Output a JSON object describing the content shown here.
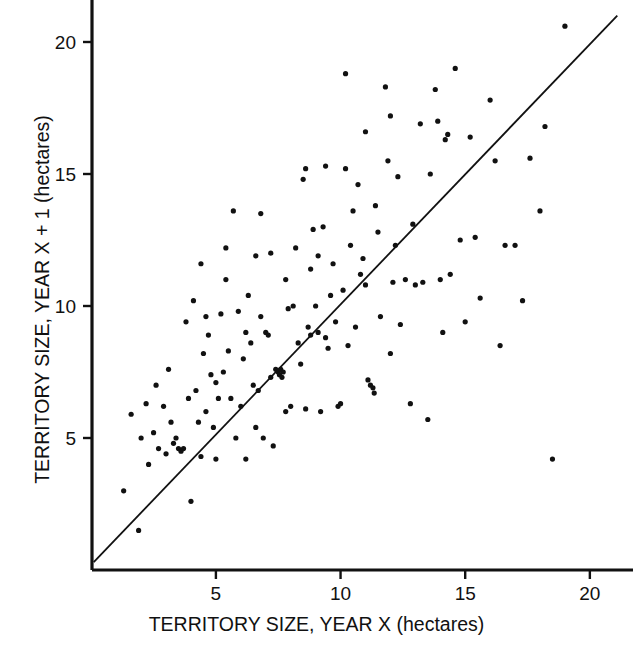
{
  "figure": {
    "background_color": "#ffffff",
    "ink_color": "#111111",
    "caption_fragment": ""
  },
  "axes": {
    "x": {
      "title": "TERRITORY SIZE, YEAR X (hectares)",
      "ticks": [
        5,
        10,
        15,
        20
      ],
      "tick_labels": [
        "5",
        "10",
        "15",
        "20"
      ],
      "range": [
        0,
        21.6
      ]
    },
    "y": {
      "title": "TERRITORY SIZE, YEAR X + 1 (hectares)",
      "ticks": [
        5,
        10,
        15,
        20
      ],
      "tick_labels": [
        "5",
        "10",
        "15",
        "20"
      ],
      "range": [
        0,
        21.6
      ]
    }
  },
  "reference_line": {
    "name": "identity-line",
    "from": [
      0.1,
      0.3
    ],
    "to": [
      21.1,
      21.0
    ],
    "color": "#111111",
    "width": 1.8
  },
  "chart_data": {
    "type": "scatter",
    "title": "",
    "subtitle": "",
    "xlabel": "TERRITORY SIZE, YEAR X (hectares)",
    "ylabel": "TERRITORY SIZE, YEAR X + 1 (hectares)",
    "xlim": [
      0,
      21.6
    ],
    "ylim": [
      0,
      21.6
    ],
    "xticks": [
      5,
      10,
      15,
      20
    ],
    "yticks": [
      5,
      10,
      15,
      20
    ],
    "grid": false,
    "legend": null,
    "marker": {
      "shape": "circle",
      "size": 5.2,
      "color": "#111111"
    },
    "annotations": [
      {
        "type": "line",
        "label": "y = x reference line",
        "from": [
          0.1,
          0.3
        ],
        "to": [
          21.1,
          21.0
        ]
      }
    ],
    "series": [
      {
        "name": "territory size year X vs year X+1",
        "points": [
          [
            1.3,
            3.0
          ],
          [
            1.6,
            5.9
          ],
          [
            1.9,
            1.5
          ],
          [
            2.0,
            5.0
          ],
          [
            2.2,
            6.3
          ],
          [
            2.3,
            4.0
          ],
          [
            2.5,
            5.2
          ],
          [
            2.7,
            4.6
          ],
          [
            2.9,
            6.2
          ],
          [
            3.0,
            4.4
          ],
          [
            3.1,
            7.6
          ],
          [
            3.2,
            5.6
          ],
          [
            3.3,
            4.8
          ],
          [
            3.4,
            5.0
          ],
          [
            3.5,
            4.6
          ],
          [
            3.6,
            4.5
          ],
          [
            3.7,
            4.6
          ],
          [
            3.9,
            6.5
          ],
          [
            4.0,
            2.6
          ],
          [
            4.1,
            10.2
          ],
          [
            4.2,
            6.8
          ],
          [
            4.3,
            5.6
          ],
          [
            4.4,
            4.3
          ],
          [
            4.5,
            8.2
          ],
          [
            4.6,
            6.0
          ],
          [
            4.7,
            8.9
          ],
          [
            4.8,
            7.4
          ],
          [
            4.9,
            5.4
          ],
          [
            5.0,
            4.2
          ],
          [
            5.1,
            6.5
          ],
          [
            5.2,
            9.7
          ],
          [
            5.3,
            7.5
          ],
          [
            5.4,
            11.0
          ],
          [
            5.5,
            8.3
          ],
          [
            5.6,
            6.5
          ],
          [
            5.7,
            13.6
          ],
          [
            5.8,
            5.0
          ],
          [
            5.9,
            9.8
          ],
          [
            6.0,
            6.2
          ],
          [
            6.1,
            8.0
          ],
          [
            6.2,
            4.2
          ],
          [
            6.3,
            10.4
          ],
          [
            6.4,
            8.6
          ],
          [
            6.5,
            7.0
          ],
          [
            6.6,
            5.4
          ],
          [
            6.7,
            6.8
          ],
          [
            6.8,
            9.6
          ],
          [
            6.9,
            5.0
          ],
          [
            7.0,
            9.0
          ],
          [
            7.1,
            8.9
          ],
          [
            7.2,
            7.3
          ],
          [
            7.3,
            4.7
          ],
          [
            7.4,
            7.6
          ],
          [
            7.5,
            7.5
          ],
          [
            7.55,
            7.4
          ],
          [
            7.6,
            7.6
          ],
          [
            7.65,
            7.3
          ],
          [
            7.7,
            7.5
          ],
          [
            7.8,
            6.0
          ],
          [
            7.9,
            9.9
          ],
          [
            8.0,
            6.2
          ],
          [
            8.1,
            10.0
          ],
          [
            8.2,
            12.2
          ],
          [
            8.3,
            8.6
          ],
          [
            8.4,
            7.8
          ],
          [
            8.5,
            14.8
          ],
          [
            8.6,
            6.1
          ],
          [
            8.7,
            9.2
          ],
          [
            8.8,
            8.9
          ],
          [
            8.9,
            12.9
          ],
          [
            9.0,
            10.0
          ],
          [
            9.1,
            9.0
          ],
          [
            9.2,
            6.0
          ],
          [
            9.3,
            13.0
          ],
          [
            9.4,
            8.8
          ],
          [
            9.5,
            8.4
          ],
          [
            9.6,
            10.4
          ],
          [
            9.7,
            11.6
          ],
          [
            9.8,
            9.4
          ],
          [
            9.9,
            6.2
          ],
          [
            10.0,
            6.3
          ],
          [
            10.1,
            10.6
          ],
          [
            10.2,
            18.8
          ],
          [
            10.3,
            8.5
          ],
          [
            10.4,
            12.3
          ],
          [
            10.5,
            13.6
          ],
          [
            10.6,
            9.2
          ],
          [
            10.7,
            14.6
          ],
          [
            10.8,
            11.2
          ],
          [
            10.9,
            11.8
          ],
          [
            11.0,
            10.8
          ],
          [
            11.1,
            7.2
          ],
          [
            11.2,
            7.0
          ],
          [
            11.3,
            6.9
          ],
          [
            11.35,
            6.7
          ],
          [
            11.4,
            13.8
          ],
          [
            11.5,
            12.8
          ],
          [
            11.6,
            9.6
          ],
          [
            11.8,
            18.3
          ],
          [
            11.9,
            15.5
          ],
          [
            12.0,
            8.2
          ],
          [
            12.1,
            10.9
          ],
          [
            12.2,
            12.3
          ],
          [
            12.3,
            14.9
          ],
          [
            12.4,
            9.3
          ],
          [
            12.6,
            11.0
          ],
          [
            12.8,
            6.3
          ],
          [
            12.9,
            13.1
          ],
          [
            13.0,
            10.8
          ],
          [
            13.2,
            16.9
          ],
          [
            13.3,
            10.9
          ],
          [
            13.5,
            5.7
          ],
          [
            13.6,
            15.0
          ],
          [
            13.8,
            18.2
          ],
          [
            13.9,
            17.0
          ],
          [
            14.0,
            11.0
          ],
          [
            14.1,
            9.0
          ],
          [
            14.2,
            16.3
          ],
          [
            14.3,
            16.5
          ],
          [
            14.4,
            11.2
          ],
          [
            14.6,
            19.0
          ],
          [
            14.8,
            12.5
          ],
          [
            15.0,
            9.4
          ],
          [
            15.2,
            16.4
          ],
          [
            15.4,
            12.6
          ],
          [
            15.6,
            10.3
          ],
          [
            16.0,
            17.8
          ],
          [
            16.2,
            15.5
          ],
          [
            16.4,
            8.5
          ],
          [
            16.6,
            12.3
          ],
          [
            17.0,
            12.3
          ],
          [
            17.3,
            10.2
          ],
          [
            17.6,
            15.6
          ],
          [
            18.0,
            13.6
          ],
          [
            18.2,
            16.8
          ],
          [
            18.5,
            4.2
          ],
          [
            19.0,
            20.6
          ],
          [
            6.6,
            11.9
          ],
          [
            7.2,
            12.0
          ],
          [
            8.6,
            15.2
          ],
          [
            9.1,
            11.9
          ],
          [
            6.8,
            13.5
          ],
          [
            5.4,
            12.2
          ],
          [
            4.6,
            9.6
          ],
          [
            7.8,
            11.0
          ],
          [
            9.4,
            15.3
          ],
          [
            10.2,
            15.2
          ],
          [
            11.0,
            16.6
          ],
          [
            12.0,
            17.2
          ],
          [
            8.8,
            11.4
          ],
          [
            6.2,
            9.0
          ],
          [
            5.0,
            7.1
          ],
          [
            3.8,
            9.4
          ],
          [
            4.4,
            11.6
          ],
          [
            2.6,
            7.0
          ]
        ]
      }
    ]
  }
}
